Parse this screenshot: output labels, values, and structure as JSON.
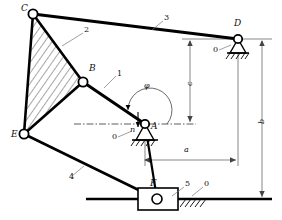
{
  "diagram": {
    "type": "mechanism-schematic",
    "stroke_color": "#000000",
    "background_color": "#ffffff",
    "dimension_color": "#555555"
  },
  "joints": [
    {
      "id": "C",
      "label": "C",
      "x": 33,
      "y": 14,
      "kind": "revolute-pin",
      "label_x": 21,
      "label_y": 8
    },
    {
      "id": "B",
      "label": "B",
      "x": 83,
      "y": 82,
      "kind": "revolute-pin",
      "label_x": 90,
      "label_y": 68
    },
    {
      "id": "E",
      "label": "E",
      "x": 24,
      "y": 134,
      "kind": "revolute-pin",
      "label_x": 13,
      "label_y": 134
    },
    {
      "id": "A",
      "label": "A",
      "x": 145,
      "y": 124,
      "kind": "fixed-pivot",
      "label_x": 152,
      "label_y": 126
    },
    {
      "id": "D",
      "label": "D",
      "x": 238,
      "y": 39,
      "kind": "fixed-pivot",
      "label_x": 236,
      "label_y": 24
    },
    {
      "id": "F",
      "label": "F",
      "x": 157,
      "y": 199,
      "kind": "slider-block",
      "label_x": 153,
      "label_y": 184
    }
  ],
  "links": [
    {
      "id": "1",
      "label": "1",
      "from": "B",
      "to": "A",
      "leader_x": 118,
      "leader_y": 74,
      "leader_to_x": 104,
      "leader_to_y": 88
    },
    {
      "id": "2",
      "label": "2",
      "from": "C",
      "to": "B",
      "leader_x": 85,
      "leader_y": 31,
      "leader_to_x": 62,
      "leader_to_y": 46
    },
    {
      "id": "3",
      "label": "3",
      "from": "C",
      "to": "D",
      "leader_x": 165,
      "leader_y": 18,
      "leader_to_x": 152,
      "leader_to_y": 30
    },
    {
      "id": "4",
      "label": "4",
      "from": "E",
      "to": "F",
      "leader_x": 70,
      "leader_y": 178,
      "leader_to_x": 82,
      "leader_to_y": 166
    },
    {
      "id": "5",
      "label": "5",
      "from": "A",
      "to": "F",
      "leader_x": 186,
      "leader_y": 184,
      "leader_to_x": 172,
      "leader_to_y": 196
    }
  ],
  "ground_labels": [
    {
      "id": "ground-A",
      "label": "0",
      "x": 113,
      "y": 139,
      "leader_to_x": 132,
      "leader_to_y": 132
    },
    {
      "id": "ground-D",
      "label": "0",
      "x": 214,
      "y": 52,
      "leader_to_x": 231,
      "leader_to_y": 45
    },
    {
      "id": "ground-F",
      "label": "0",
      "x": 205,
      "y": 184,
      "leader_to_x": 192,
      "leader_to_y": 196
    }
  ],
  "annotations": {
    "angle_phi": {
      "label": "φ",
      "x": 146,
      "y": 86,
      "arc_radius": 22,
      "description": "crank angle measured from horizontal datum at A"
    },
    "normal_arrow": {
      "label": "n",
      "x": 133,
      "y": 124,
      "description": "direction arrow at joint A"
    }
  },
  "dimensions": [
    {
      "id": "a",
      "label": "a",
      "orientation": "horizontal",
      "label_x": 186,
      "label_y": 150,
      "x1": 145,
      "x2": 238,
      "y": 160,
      "description": "horizontal distance from A to D"
    },
    {
      "id": "b",
      "label": "b",
      "orientation": "vertical",
      "label_x": 260,
      "label_y": 120,
      "x": 262,
      "y1": 39,
      "y2": 199,
      "description": "vertical distance from D to slider axis F"
    },
    {
      "id": "c",
      "label": "c",
      "orientation": "vertical",
      "label_x": 187,
      "label_y": 82,
      "x": 190,
      "y1": 39,
      "y2": 124,
      "description": "vertical distance from D to A"
    }
  ],
  "hatched_region": {
    "id": "ternary-link-2",
    "vertices": [
      "C",
      "B",
      "E"
    ],
    "pattern": "diagonal-lines",
    "description": "ternary link 2 shown hatched between joints C, B and E"
  },
  "slider_axis": {
    "id": "slider-guide",
    "x1": 86,
    "x2": 272,
    "y": 199,
    "description": "horizontal guide line for slider 5 at F"
  },
  "datum_line": {
    "id": "centerline-through-A",
    "x1": 74,
    "x2": 196,
    "y": 124,
    "style": "dash-dot",
    "description": "horizontal centerline datum through pivot A"
  }
}
